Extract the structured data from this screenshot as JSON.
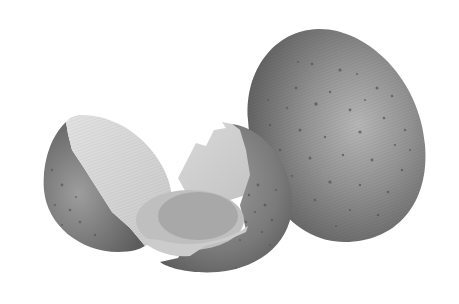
{
  "image": {
    "caption": "",
    "subject": "speckled eggs illustration",
    "background_color": "#ffffff"
  },
  "objects": [
    {
      "name": "whole-egg",
      "description": "Large whole speckled egg, right side",
      "base_color": "#8a8a8a",
      "highlight_color": "#b4b4b4",
      "shadow_color": "#5e5e5e",
      "speckle_color": "#555555"
    },
    {
      "name": "left-shell-half",
      "description": "Left cracked shell half showing light interior",
      "outer_color": "#7d7d7d",
      "inner_color": "#d6d6d6"
    },
    {
      "name": "middle-shell-half",
      "description": "Middle cracked shell half holding egg contents",
      "outer_color": "#6f6f6f",
      "inner_color": "#cfcfcf"
    },
    {
      "name": "egg-contents",
      "description": "Egg white and yolk inside the middle shell",
      "white_color": "#bdbdbd",
      "yolk_color": "#a6a6a6"
    }
  ]
}
